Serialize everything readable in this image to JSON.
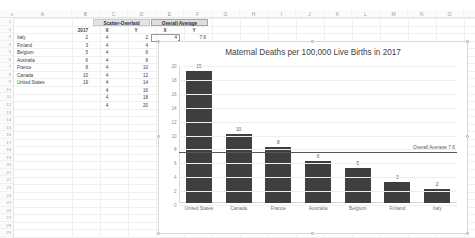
{
  "app": {
    "name": "spreadsheet",
    "title": "Excel Worksheet with Chart"
  },
  "sheet": {
    "column_headers": [
      "A",
      "B",
      "C",
      "D",
      "E",
      "F",
      "G",
      "H",
      "I",
      "J",
      "K",
      "L",
      "M",
      "N",
      "O"
    ],
    "row_headers": [
      "1",
      "2",
      "3",
      "4",
      "5",
      "6",
      "7",
      "8",
      "9",
      "10",
      "11",
      "12",
      "13",
      "14",
      "15",
      "16",
      "17",
      "18",
      "19",
      "20",
      "21",
      "22",
      "23",
      "24",
      "25",
      "26",
      "27",
      "28",
      "29"
    ],
    "merged_headers": [
      {
        "label": "Scatter-Overlaid",
        "name": "scatter-overlaid-header"
      },
      {
        "label": "Overall Average",
        "name": "overall-average-header"
      }
    ],
    "header_row": {
      "b": "2017",
      "c": "X",
      "d": "Y",
      "e": "X",
      "f": "Y"
    },
    "rows": [
      {
        "country": "Italy",
        "value": "2",
        "x": "4",
        "y": "2"
      },
      {
        "country": "Finland",
        "value": "3",
        "x": "4",
        "y": "4"
      },
      {
        "country": "Belgium",
        "value": "5",
        "x": "4",
        "y": "6"
      },
      {
        "country": "Australia",
        "value": "6",
        "x": "4",
        "y": "8"
      },
      {
        "country": "France",
        "value": "8",
        "x": "4",
        "y": "10"
      },
      {
        "country": "Canada",
        "value": "10",
        "x": "4",
        "y": "12"
      },
      {
        "country": "United States",
        "value": "19",
        "x": "4",
        "y": "14"
      },
      {
        "country": "",
        "value": "",
        "x": "4",
        "y": "16"
      },
      {
        "country": "",
        "value": "",
        "x": "4",
        "y": "18"
      },
      {
        "country": "",
        "value": "",
        "x": "4",
        "y": "20"
      }
    ],
    "overall_average": {
      "x": "4",
      "y": "7.6"
    }
  },
  "chart_data": {
    "type": "bar",
    "title": "Maternal Deaths per 100,000 Live Births in 2017",
    "xlabel": "",
    "ylabel": "",
    "categories": [
      "United States",
      "Canada",
      "France",
      "Australia",
      "Belgium",
      "Finland",
      "Italy"
    ],
    "values": [
      19,
      10,
      8,
      6,
      5,
      3,
      2
    ],
    "data_labels": [
      "19",
      "10",
      "8",
      "6",
      "5",
      "3",
      "2"
    ],
    "ylim": [
      0,
      20
    ],
    "yticks": [
      "0",
      "2",
      "4",
      "6",
      "8",
      "10",
      "12",
      "14",
      "16",
      "18",
      "20"
    ],
    "grid": true,
    "legend": "none",
    "bar_color": "#3f3f3f",
    "annotations": [
      {
        "name": "overall-average-line",
        "label": "Overall Average 7.6",
        "value": 7.6,
        "color": "#585858"
      }
    ]
  }
}
